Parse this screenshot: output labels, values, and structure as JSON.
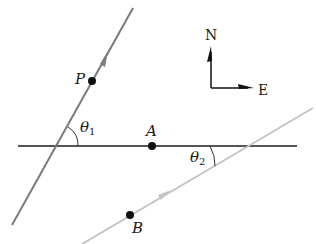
{
  "diagram": {
    "type": "geometry-paths",
    "colors": {
      "background": "#ffffff",
      "horizontal_line": "#555555",
      "path_p": "#7a7a7a",
      "path_b": "#c4c4c4",
      "points": "#111111",
      "compass": "#111111"
    },
    "horizontal_line": {
      "x1": 18,
      "y1": 146,
      "x2": 297,
      "y2": 146
    },
    "path_p": {
      "x1": 12,
      "y1": 225,
      "x2": 133,
      "y2": 8,
      "arrow": {
        "x": 105,
        "y": 58
      }
    },
    "path_b": {
      "x1": 82,
      "y1": 244,
      "x2": 313,
      "y2": 108,
      "arrow": {
        "x": 165,
        "y": 195
      }
    },
    "points": [
      {
        "name": "P",
        "label": "P",
        "x": 92,
        "y": 81
      },
      {
        "name": "A",
        "label": "A",
        "x": 152,
        "y": 146
      },
      {
        "name": "B",
        "label": "B",
        "x": 130,
        "y": 215
      }
    ],
    "angles": [
      {
        "name": "theta1",
        "symbol": "θ",
        "subscript": "1"
      },
      {
        "name": "theta2",
        "symbol": "θ",
        "subscript": "2"
      }
    ],
    "compass": {
      "north_label": "N",
      "east_label": "E"
    }
  }
}
